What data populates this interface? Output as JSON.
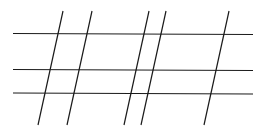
{
  "diagram": {
    "type": "line-grid",
    "stroke_color": "#1a1a1a",
    "background": "#ffffff",
    "horizontal_lines": [
      {
        "x1": 13,
        "y1": 33.5,
        "x2": 253,
        "y2": 34.5
      },
      {
        "x1": 13,
        "y1": 69.5,
        "x2": 253,
        "y2": 70.5
      },
      {
        "x1": 13,
        "y1": 93,
        "x2": 253,
        "y2": 94
      }
    ],
    "transversals": [
      {
        "x1": 63,
        "y1": 11,
        "x2": 38,
        "y2": 125
      },
      {
        "x1": 92,
        "y1": 11,
        "x2": 67,
        "y2": 125
      },
      {
        "x1": 149,
        "y1": 11,
        "x2": 124,
        "y2": 125
      },
      {
        "x1": 166,
        "y1": 11,
        "x2": 141,
        "y2": 125
      },
      {
        "x1": 229,
        "y1": 11,
        "x2": 204,
        "y2": 125
      }
    ]
  }
}
